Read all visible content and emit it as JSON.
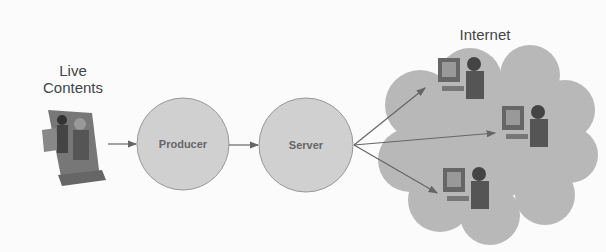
{
  "diagram": {
    "source": {
      "label_line1": "Live",
      "label_line2": "Contents",
      "icon": "video-camera-people-icon"
    },
    "nodes": [
      {
        "id": "producer",
        "label": "Producer"
      },
      {
        "id": "server",
        "label": "Server"
      }
    ],
    "cloud": {
      "label": "Internet",
      "clients": 3,
      "client_icon": "person-at-computer-icon"
    },
    "edges": [
      {
        "from": "live-contents",
        "to": "producer"
      },
      {
        "from": "producer",
        "to": "server"
      },
      {
        "from": "server",
        "to": "client-1"
      },
      {
        "from": "server",
        "to": "client-2"
      },
      {
        "from": "server",
        "to": "client-3"
      }
    ],
    "colors": {
      "node_fill": "#cfcfcf",
      "cloud_fill": "#b5b5b5",
      "arrow": "#666666"
    }
  }
}
